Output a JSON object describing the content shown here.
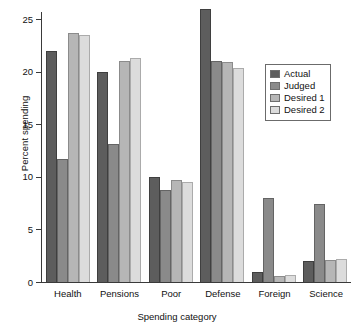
{
  "chart_data": {
    "type": "bar",
    "title": "",
    "subtitle": "",
    "xlabel": "Spending category",
    "ylabel": "Percent spending",
    "categories": [
      "Health",
      "Pensions",
      "Poor",
      "Defense",
      "Foreign",
      "Science"
    ],
    "series": [
      {
        "name": "Actual",
        "color": "#5d5d5d",
        "values": [
          22.0,
          20.0,
          10.0,
          26.0,
          1.0,
          2.0
        ]
      },
      {
        "name": "Judged",
        "color": "#8a8a8a",
        "values": [
          11.7,
          13.1,
          8.8,
          21.0,
          8.0,
          7.4
        ]
      },
      {
        "name": "Desired 1",
        "color": "#b6b6b6",
        "values": [
          23.7,
          21.0,
          9.7,
          20.9,
          0.6,
          2.1
        ]
      },
      {
        "name": "Desired 2",
        "color": "#dcdcdc",
        "values": [
          23.5,
          21.3,
          9.5,
          20.4,
          0.7,
          2.2
        ]
      }
    ],
    "ylim": [
      0,
      25.8
    ],
    "yticks": [
      0,
      5,
      10,
      15,
      20,
      25
    ],
    "ytick_labels": [
      "0",
      "5",
      "10",
      "15",
      "20",
      "25"
    ],
    "grid": false,
    "legend_position": "top-right",
    "legend_entries": [
      "Actual",
      "Judged",
      "Desired 1",
      "Desired 2"
    ]
  }
}
